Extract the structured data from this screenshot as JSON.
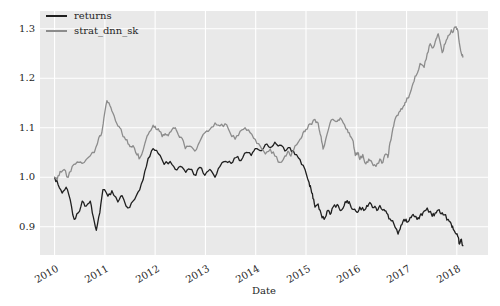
{
  "figure": {
    "background": "#ffffff"
  },
  "axes": {
    "background": "#e9e9e9",
    "grid_color": "#ffffff",
    "text_color": "#262626"
  },
  "legend": {
    "position": "upper left",
    "items": [
      {
        "label": "returns",
        "color": "#1f1f1f"
      },
      {
        "label": "strat_dnn_sk",
        "color": "#8c8c8c"
      }
    ]
  },
  "chart_data": {
    "type": "line",
    "title": "",
    "xlabel": "Date",
    "ylabel": "",
    "grid": true,
    "legend_position": "upper left",
    "x_ticks": [
      "2010",
      "2011",
      "2012",
      "2013",
      "2014",
      "2015",
      "2016",
      "2017",
      "2018"
    ],
    "x_tick_values": [
      2010,
      2011,
      2012,
      2013,
      2014,
      2015,
      2016,
      2017,
      2018
    ],
    "y_ticks": [
      "0.9",
      "1.0",
      "1.1",
      "1.2",
      "1.3"
    ],
    "y_tick_values": [
      0.9,
      1.0,
      1.1,
      1.2,
      1.3
    ],
    "xlim": [
      2009.71,
      2018.62
    ],
    "ylim": [
      0.843,
      1.336
    ],
    "series": [
      {
        "name": "returns",
        "color": "#1f1f1f",
        "x": [
          2010.0,
          2010.07,
          2010.15,
          2010.23,
          2010.31,
          2010.39,
          2010.47,
          2010.55,
          2010.63,
          2010.71,
          2010.77,
          2010.83,
          2010.9,
          2010.96,
          2011.06,
          2011.14,
          2011.26,
          2011.34,
          2011.46,
          2011.56,
          2011.66,
          2011.76,
          2011.86,
          2011.96,
          2012.06,
          2012.18,
          2012.3,
          2012.4,
          2012.5,
          2012.61,
          2012.69,
          2012.81,
          2012.89,
          2012.99,
          2013.09,
          2013.19,
          2013.29,
          2013.41,
          2013.51,
          2013.61,
          2013.71,
          2013.81,
          2013.91,
          2013.99,
          2014.09,
          2014.19,
          2014.29,
          2014.38,
          2014.48,
          2014.58,
          2014.68,
          2014.78,
          2014.88,
          2014.98,
          2015.06,
          2015.1,
          2015.14,
          2015.18,
          2015.24,
          2015.3,
          2015.36,
          2015.42,
          2015.48,
          2015.54,
          2015.62,
          2015.68,
          2015.76,
          2015.82,
          2015.88,
          2015.94,
          2016.02,
          2016.07,
          2016.15,
          2016.21,
          2016.27,
          2016.35,
          2016.41,
          2016.47,
          2016.55,
          2016.61,
          2016.67,
          2016.75,
          2016.83,
          2016.89,
          2016.95,
          2017.01,
          2017.07,
          2017.13,
          2017.21,
          2017.27,
          2017.33,
          2017.41,
          2017.51,
          2017.57,
          2017.63,
          2017.69,
          2017.75,
          2017.83,
          2017.89,
          2017.93,
          2017.99,
          2018.03,
          2018.05,
          2018.09,
          2018.12
        ],
        "y": [
          1.0,
          0.985,
          0.968,
          0.98,
          0.955,
          0.915,
          0.928,
          0.952,
          0.942,
          0.952,
          0.92,
          0.893,
          0.928,
          0.975,
          0.962,
          0.973,
          0.95,
          0.963,
          0.938,
          0.952,
          0.97,
          0.995,
          1.038,
          1.058,
          1.048,
          1.026,
          1.032,
          1.016,
          1.022,
          1.01,
          1.016,
          1.004,
          1.02,
          1.004,
          1.016,
          1.0,
          1.022,
          1.032,
          1.028,
          1.04,
          1.034,
          1.05,
          1.044,
          1.058,
          1.054,
          1.066,
          1.06,
          1.071,
          1.065,
          1.053,
          1.06,
          1.046,
          1.036,
          1.016,
          0.99,
          0.976,
          0.957,
          0.94,
          0.946,
          0.926,
          0.915,
          0.932,
          0.925,
          0.94,
          0.945,
          0.933,
          0.943,
          0.953,
          0.945,
          0.935,
          0.929,
          0.94,
          0.933,
          0.943,
          0.949,
          0.939,
          0.933,
          0.943,
          0.935,
          0.927,
          0.916,
          0.905,
          0.885,
          0.903,
          0.915,
          0.909,
          0.919,
          0.925,
          0.915,
          0.923,
          0.929,
          0.938,
          0.921,
          0.928,
          0.934,
          0.926,
          0.924,
          0.915,
          0.905,
          0.895,
          0.885,
          0.879,
          0.865,
          0.875,
          0.862
        ]
      },
      {
        "name": "strat_dnn_sk",
        "color": "#8c8c8c",
        "x": [
          2010.0,
          2010.05,
          2010.11,
          2010.19,
          2010.27,
          2010.35,
          2010.45,
          2010.55,
          2010.67,
          2010.79,
          2010.88,
          2010.94,
          2010.98,
          2011.04,
          2011.1,
          2011.16,
          2011.24,
          2011.3,
          2011.36,
          2011.44,
          2011.5,
          2011.56,
          2011.64,
          2011.7,
          2011.8,
          2011.86,
          2011.94,
          2012.0,
          2012.06,
          2012.14,
          2012.2,
          2012.26,
          2012.34,
          2012.4,
          2012.46,
          2012.54,
          2012.6,
          2012.69,
          2012.79,
          2012.89,
          2012.99,
          2013.09,
          2013.19,
          2013.29,
          2013.39,
          2013.49,
          2013.59,
          2013.69,
          2013.79,
          2013.89,
          2013.99,
          2014.09,
          2014.19,
          2014.29,
          2014.38,
          2014.48,
          2014.58,
          2014.64,
          2014.7,
          2014.78,
          2014.88,
          2014.94,
          2015.0,
          2015.08,
          2015.18,
          2015.24,
          2015.3,
          2015.34,
          2015.42,
          2015.48,
          2015.54,
          2015.62,
          2015.68,
          2015.74,
          2015.82,
          2015.88,
          2015.94,
          2015.98,
          2016.03,
          2016.07,
          2016.13,
          2016.19,
          2016.25,
          2016.31,
          2016.39,
          2016.47,
          2016.53,
          2016.59,
          2016.63,
          2016.67,
          2016.73,
          2016.77,
          2016.83,
          2016.87,
          2016.93,
          2016.97,
          2017.03,
          2017.07,
          2017.13,
          2017.19,
          2017.27,
          2017.35,
          2017.41,
          2017.47,
          2017.53,
          2017.59,
          2017.63,
          2017.71,
          2017.77,
          2017.83,
          2017.89,
          2017.93,
          2017.97,
          2018.01,
          2018.05,
          2018.09,
          2018.12
        ],
        "y": [
          1.0,
          0.995,
          1.012,
          1.016,
          1.0,
          1.022,
          1.031,
          1.028,
          1.04,
          1.05,
          1.08,
          1.09,
          1.12,
          1.155,
          1.145,
          1.13,
          1.108,
          1.1,
          1.082,
          1.076,
          1.062,
          1.064,
          1.045,
          1.04,
          1.07,
          1.086,
          1.1,
          1.103,
          1.098,
          1.082,
          1.088,
          1.084,
          1.097,
          1.1,
          1.086,
          1.078,
          1.058,
          1.063,
          1.053,
          1.073,
          1.09,
          1.097,
          1.11,
          1.104,
          1.108,
          1.09,
          1.077,
          1.093,
          1.1,
          1.09,
          1.077,
          1.063,
          1.047,
          1.057,
          1.043,
          1.03,
          1.043,
          1.053,
          1.043,
          1.063,
          1.077,
          1.09,
          1.097,
          1.108,
          1.117,
          1.11,
          1.082,
          1.057,
          1.087,
          1.11,
          1.117,
          1.113,
          1.12,
          1.11,
          1.097,
          1.083,
          1.073,
          1.044,
          1.05,
          1.036,
          1.046,
          1.027,
          1.037,
          1.03,
          1.022,
          1.037,
          1.03,
          1.047,
          1.04,
          1.07,
          1.1,
          1.117,
          1.125,
          1.133,
          1.142,
          1.151,
          1.16,
          1.17,
          1.19,
          1.205,
          1.23,
          1.222,
          1.25,
          1.27,
          1.262,
          1.28,
          1.29,
          1.252,
          1.27,
          1.287,
          1.298,
          1.294,
          1.303,
          1.3,
          1.272,
          1.25,
          1.243
        ]
      }
    ]
  }
}
